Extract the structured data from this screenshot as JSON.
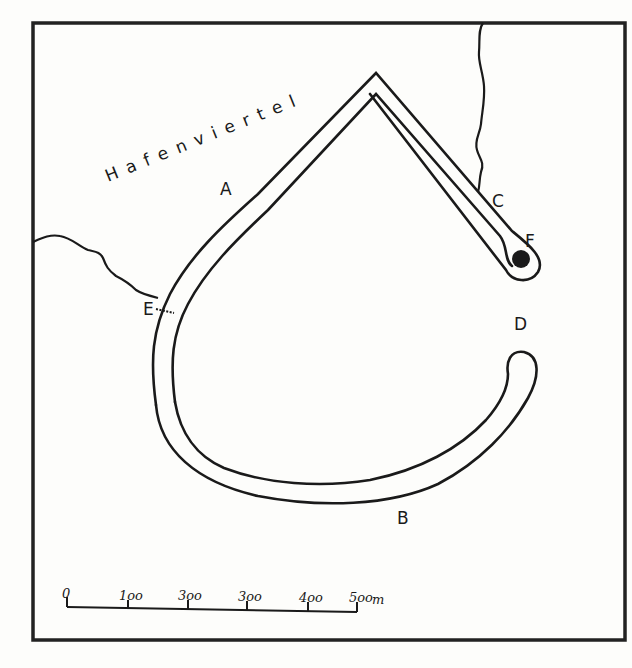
{
  "map": {
    "district_label": "Hafenviertel",
    "points": [
      {
        "id": "A",
        "label": "A",
        "x": 228,
        "y": 192
      },
      {
        "id": "B",
        "label": "B",
        "x": 403,
        "y": 522
      },
      {
        "id": "C",
        "label": "C",
        "x": 499,
        "y": 206
      },
      {
        "id": "D",
        "label": "D",
        "x": 522,
        "y": 329
      },
      {
        "id": "E",
        "label": "E",
        "x": 149,
        "y": 315
      },
      {
        "id": "F",
        "label": "F",
        "x": 531,
        "y": 246
      }
    ],
    "marker": {
      "name": "filled-circle",
      "x": 521,
      "y": 259,
      "r": 9
    }
  },
  "scale_bar": {
    "unit": "m",
    "ticks": [
      "0",
      "100",
      "200",
      "300",
      "400",
      "500"
    ],
    "tick_labels_as_drawn": [
      "0",
      "1oo",
      "3oo",
      "3oo",
      "4oo",
      "5oo"
    ]
  },
  "caption": {
    "text": "Bild ... (caption cut off, illegible)"
  },
  "colors": {
    "ink": "#1a1a1a",
    "paper": "#fdfdfb"
  }
}
